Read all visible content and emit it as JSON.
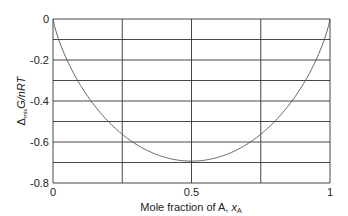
{
  "chart_data": {
    "type": "line",
    "title": "",
    "xlabel": "Mole fraction of A, x_A",
    "ylabel": "Δmix G/nRT",
    "xlim": [
      0,
      1
    ],
    "ylim": [
      -0.8,
      0
    ],
    "grid": true,
    "x_ticks": [
      "0",
      "0.5",
      "1"
    ],
    "y_ticks": [
      "0",
      "-0.2",
      "-0.4",
      "-0.6",
      "-0.8"
    ],
    "series": [
      {
        "name": "Δmix G/nRT = xA ln xA + (1−xA) ln(1−xA)",
        "x": [
          0,
          0.05,
          0.1,
          0.15,
          0.2,
          0.25,
          0.3,
          0.35,
          0.4,
          0.45,
          0.5,
          0.55,
          0.6,
          0.65,
          0.7,
          0.75,
          0.8,
          0.85,
          0.9,
          0.95,
          1
        ],
        "values": [
          0,
          -0.199,
          -0.325,
          -0.423,
          -0.5,
          -0.562,
          -0.611,
          -0.647,
          -0.673,
          -0.688,
          -0.693,
          -0.688,
          -0.673,
          -0.647,
          -0.611,
          -0.562,
          -0.5,
          -0.423,
          -0.325,
          -0.199,
          0
        ]
      }
    ]
  },
  "axis": {
    "y_tick_labels": [
      "0",
      "-0.2",
      "-0.4",
      "-0.6",
      "-0.8"
    ],
    "x_tick_labels": [
      "0",
      "0.5",
      "1"
    ],
    "xlabel_main": "Mole fraction of A, ",
    "xlabel_var": "x",
    "xlabel_sub": "A",
    "ylabel_delta": "Δ",
    "ylabel_sub": "mix",
    "ylabel_main": "G/nRT"
  }
}
